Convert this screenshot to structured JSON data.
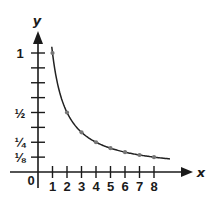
{
  "chart_data": {
    "type": "line",
    "title": "",
    "function": "y = 1/x",
    "xlabel": "x",
    "ylabel": "y",
    "origin_label": "0",
    "x_ticks": [
      "1",
      "2",
      "3",
      "4",
      "5",
      "6",
      "7",
      "8"
    ],
    "y_tick_labels": [
      {
        "value": 1,
        "label": "1"
      },
      {
        "value": 0.5,
        "label": "½"
      },
      {
        "value": 0.25,
        "label": "¼"
      },
      {
        "value": 0.125,
        "label": "⅛"
      }
    ],
    "y_tick_step": 0.125,
    "xlim": [
      0,
      9
    ],
    "ylim": [
      0,
      1.1
    ],
    "grid": false,
    "series": [
      {
        "name": "y = 1/x",
        "x": [
          1,
          2,
          3,
          4,
          5,
          6,
          7,
          8
        ],
        "values": [
          1,
          0.5,
          0.333,
          0.25,
          0.2,
          0.167,
          0.143,
          0.125
        ],
        "curve_x_range": [
          0.95,
          9.1
        ]
      }
    ],
    "colors": {
      "axis": "#1a1a1a",
      "curve": "#222222",
      "points": "#777777"
    }
  }
}
